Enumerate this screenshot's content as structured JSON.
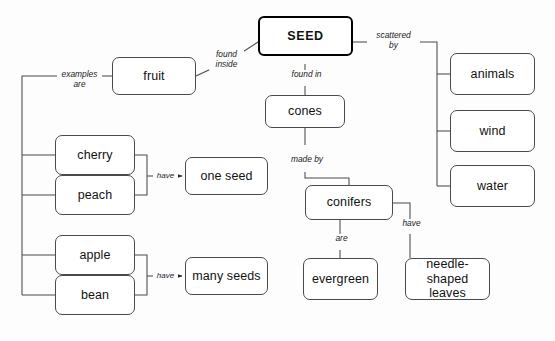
{
  "diagram": {
    "type": "concept-map",
    "background": "#fdfdfd",
    "stroke": "#4a4a4a",
    "root_stroke": "#000000"
  },
  "nodes": {
    "seed": "SEED",
    "fruit": "fruit",
    "cones": "cones",
    "animals": "animals",
    "wind": "wind",
    "water": "water",
    "cherry": "cherry",
    "peach": "peach",
    "apple": "apple",
    "bean": "bean",
    "one_seed": "one seed",
    "many_seeds": "many seeds",
    "conifers": "conifers",
    "evergreen": "evergreen",
    "needle_leaves": "needle-shaped\nleaves"
  },
  "labels": {
    "found_inside": "found\ninside",
    "scattered_by": "scattered\nby",
    "found_in": "found in",
    "made_by": "made by",
    "examples_are": "examples are",
    "have_one": "have",
    "have_many": "have",
    "are": "are",
    "have_leaves": "have"
  },
  "relations": [
    {
      "from": "seed",
      "label": "found inside",
      "to": "fruit"
    },
    {
      "from": "seed",
      "label": "scattered by",
      "to": [
        "animals",
        "wind",
        "water"
      ]
    },
    {
      "from": "seed",
      "label": "found in",
      "to": "cones"
    },
    {
      "from": "cones",
      "label": "made by",
      "to": "conifers"
    },
    {
      "from": "fruit",
      "label": "examples are",
      "to": [
        "cherry",
        "peach",
        "apple",
        "bean"
      ]
    },
    {
      "from": [
        "cherry",
        "peach"
      ],
      "label": "have",
      "to": "one seed"
    },
    {
      "from": [
        "apple",
        "bean"
      ],
      "label": "have",
      "to": "many seeds"
    },
    {
      "from": "conifers",
      "label": "are",
      "to": "evergreen"
    },
    {
      "from": "conifers",
      "label": "have",
      "to": "needle-shaped leaves"
    }
  ]
}
